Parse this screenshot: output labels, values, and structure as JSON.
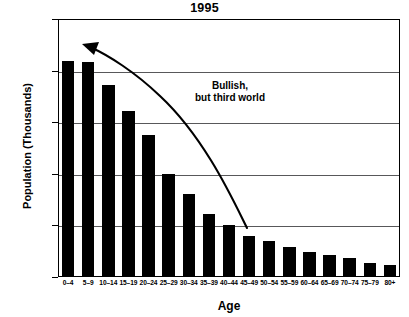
{
  "chart_data": {
    "type": "bar",
    "title": "1995",
    "xlabel": "Age",
    "ylabel": "Population (Thousands)",
    "categories": [
      "0–4",
      "5–9",
      "10–14",
      "15–19",
      "20–24",
      "25–29",
      "30–34",
      "35–39",
      "40–44",
      "45–49",
      "50–54",
      "55–59",
      "60–64",
      "65–69",
      "70–74",
      "75–79",
      "80+"
    ],
    "values": [
      2090,
      2080,
      1860,
      1610,
      1380,
      1000,
      800,
      610,
      500,
      400,
      350,
      290,
      245,
      215,
      185,
      135,
      115
    ],
    "ylim": [
      0,
      2500
    ],
    "ytick_values": [
      0,
      500,
      1000,
      1500,
      2000,
      2500
    ],
    "ytick_labels": [
      "0",
      "500",
      "1,000",
      "1,500",
      "2,000",
      "2,500"
    ],
    "grid": "horizontal",
    "legend": "none",
    "bar_color": "#000000",
    "grid_color": "#58585a",
    "axis_color": "#000000",
    "annotations": [
      {
        "name": "bullish-note",
        "line1": "Bullish,",
        "line2": "but third world",
        "arrow": "curved arrow pointing up-left from lower-right of plot toward the tallest bars"
      }
    ]
  }
}
